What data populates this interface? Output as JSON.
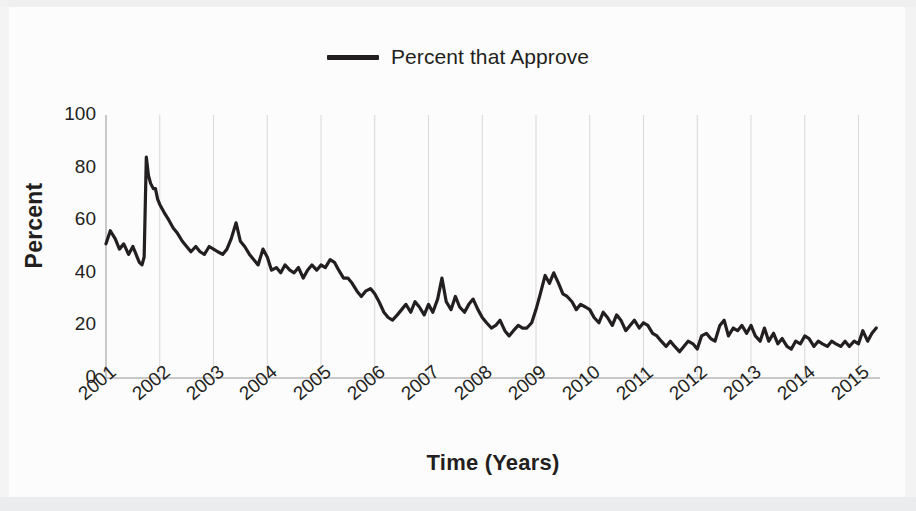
{
  "legend": {
    "position": "top-center",
    "entries": [
      {
        "label": "Percent that Approve",
        "color": "#231f20",
        "marker": "line-swatch"
      }
    ]
  },
  "axes": {
    "y_title": "Percent",
    "x_title": "Time (Years)",
    "y_ticks": [
      "0",
      "20",
      "40",
      "60",
      "80",
      "100"
    ],
    "x_ticks": [
      "2001",
      "2002",
      "2003",
      "2004",
      "2005",
      "2006",
      "2007",
      "2008",
      "2009",
      "2010",
      "2011",
      "2012",
      "2013",
      "2014",
      "2015"
    ]
  },
  "colors": {
    "line": "#231f20",
    "gridline": "#d8d8da",
    "axis": "#b9b9bc",
    "text": "#231f20",
    "background": "#fcfcfc"
  },
  "chart_data": {
    "type": "line",
    "title": "",
    "xlabel": "Time (Years)",
    "ylabel": "Percent",
    "xlim": [
      2001,
      2015.4
    ],
    "ylim": [
      0,
      100
    ],
    "grid": true,
    "grid_axis": "x",
    "legend_position": "top-center",
    "categories": [
      "2001",
      "2002",
      "2003",
      "2004",
      "2005",
      "2006",
      "2007",
      "2008",
      "2009",
      "2010",
      "2011",
      "2012",
      "2013",
      "2014",
      "2015"
    ],
    "series": [
      {
        "name": "Percent that Approve",
        "color": "#231f20",
        "x": [
          2001.0,
          2001.08,
          2001.17,
          2001.25,
          2001.33,
          2001.42,
          2001.5,
          2001.58,
          2001.62,
          2001.67,
          2001.71,
          2001.75,
          2001.79,
          2001.83,
          2001.88,
          2001.92,
          2001.96,
          2002.0,
          2002.08,
          2002.17,
          2002.25,
          2002.33,
          2002.42,
          2002.5,
          2002.58,
          2002.67,
          2002.75,
          2002.83,
          2002.92,
          2003.0,
          2003.08,
          2003.17,
          2003.25,
          2003.33,
          2003.42,
          2003.5,
          2003.58,
          2003.67,
          2003.75,
          2003.83,
          2003.92,
          2004.0,
          2004.08,
          2004.17,
          2004.25,
          2004.33,
          2004.42,
          2004.5,
          2004.58,
          2004.67,
          2004.75,
          2004.83,
          2004.92,
          2005.0,
          2005.08,
          2005.17,
          2005.25,
          2005.33,
          2005.42,
          2005.5,
          2005.58,
          2005.67,
          2005.75,
          2005.83,
          2005.92,
          2006.0,
          2006.08,
          2006.17,
          2006.25,
          2006.33,
          2006.42,
          2006.5,
          2006.58,
          2006.67,
          2006.75,
          2006.83,
          2006.92,
          2007.0,
          2007.08,
          2007.17,
          2007.25,
          2007.33,
          2007.42,
          2007.5,
          2007.58,
          2007.67,
          2007.75,
          2007.83,
          2007.92,
          2008.0,
          2008.08,
          2008.17,
          2008.25,
          2008.33,
          2008.42,
          2008.5,
          2008.58,
          2008.67,
          2008.75,
          2008.83,
          2008.92,
          2009.0,
          2009.08,
          2009.17,
          2009.25,
          2009.33,
          2009.42,
          2009.5,
          2009.58,
          2009.67,
          2009.75,
          2009.83,
          2009.92,
          2010.0,
          2010.08,
          2010.17,
          2010.25,
          2010.33,
          2010.42,
          2010.5,
          2010.58,
          2010.67,
          2010.75,
          2010.83,
          2010.92,
          2011.0,
          2011.08,
          2011.17,
          2011.25,
          2011.33,
          2011.42,
          2011.5,
          2011.58,
          2011.67,
          2011.75,
          2011.83,
          2011.92,
          2012.0,
          2012.08,
          2012.17,
          2012.25,
          2012.33,
          2012.42,
          2012.5,
          2012.58,
          2012.67,
          2012.75,
          2012.83,
          2012.92,
          2013.0,
          2013.08,
          2013.17,
          2013.25,
          2013.33,
          2013.42,
          2013.5,
          2013.58,
          2013.67,
          2013.75,
          2013.83,
          2013.92,
          2014.0,
          2014.08,
          2014.17,
          2014.25,
          2014.33,
          2014.42,
          2014.5,
          2014.58,
          2014.67,
          2014.75,
          2014.83,
          2014.92,
          2015.0,
          2015.08,
          2015.17,
          2015.25,
          2015.33
        ],
        "values": [
          51,
          56,
          53,
          49,
          51,
          47,
          50,
          46,
          44,
          43,
          46,
          84,
          77,
          74,
          72,
          72,
          68,
          66,
          63,
          60,
          57,
          55,
          52,
          50,
          48,
          50,
          48,
          47,
          50,
          49,
          48,
          47,
          49,
          53,
          59,
          52,
          50,
          47,
          45,
          43,
          49,
          46,
          41,
          42,
          40,
          43,
          41,
          40,
          42,
          38,
          41,
          43,
          41,
          43,
          42,
          45,
          44,
          41,
          38,
          38,
          36,
          33,
          31,
          33,
          34,
          32,
          29,
          25,
          23,
          22,
          24,
          26,
          28,
          25,
          29,
          27,
          24,
          28,
          25,
          30,
          38,
          29,
          26,
          31,
          27,
          25,
          28,
          30,
          26,
          23,
          21,
          19,
          20,
          22,
          18,
          16,
          18,
          20,
          19,
          19,
          21,
          26,
          32,
          39,
          36,
          40,
          36,
          32,
          31,
          29,
          26,
          28,
          27,
          26,
          23,
          21,
          25,
          23,
          20,
          24,
          22,
          18,
          20,
          22,
          19,
          21,
          20,
          17,
          16,
          14,
          12,
          14,
          12,
          10,
          12,
          14,
          13,
          11,
          16,
          17,
          15,
          14,
          20,
          22,
          16,
          19,
          18,
          20,
          17,
          20,
          16,
          14,
          19,
          14,
          17,
          13,
          15,
          12,
          11,
          14,
          13,
          16,
          15,
          12,
          14,
          13,
          12,
          14,
          13,
          12,
          14,
          12,
          14,
          13,
          18,
          14,
          17,
          19
        ]
      }
    ]
  }
}
